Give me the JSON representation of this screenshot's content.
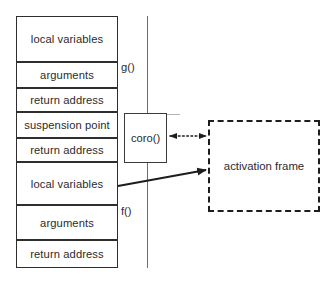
{
  "diagram": {
    "colors": {
      "row_border": "#2e2e2e",
      "bracket": "#6d6d6d",
      "coro_border": "#3a3a3a",
      "activation_border": "#1d1d1d",
      "text": "#2b2b2b",
      "background": "#ffffff"
    },
    "stack": {
      "rows": [
        {
          "label": "local variables",
          "top": 16,
          "height": 46
        },
        {
          "label": "arguments",
          "top": 62,
          "height": 26
        },
        {
          "label": "return address",
          "top": 88,
          "height": 24
        },
        {
          "label": "suspension point",
          "top": 112,
          "height": 26
        },
        {
          "label": "return address",
          "top": 138,
          "height": 24
        },
        {
          "label": "local variables",
          "top": 162,
          "height": 43
        },
        {
          "label": "arguments",
          "top": 205,
          "height": 35
        },
        {
          "label": "return address",
          "top": 240,
          "height": 28
        }
      ],
      "left": 16,
      "width": 102
    },
    "frames": [
      {
        "label": "g()",
        "x": 121,
        "y": 68
      },
      {
        "label": "f()",
        "x": 121,
        "y": 212
      }
    ],
    "coro_box": {
      "label": "coro()",
      "left": 124,
      "top": 113,
      "width": 43,
      "height": 50
    },
    "activation_box": {
      "label": "activation frame",
      "left": 208,
      "top": 120,
      "width": 112,
      "height": 92
    },
    "connectors": [
      {
        "name": "coro-activation-link",
        "style": "dotted",
        "arrows": "both",
        "from": "coro()",
        "to": "activation frame"
      },
      {
        "name": "local-variables-activation-link",
        "style": "solid",
        "arrows": "end",
        "from": "local variables",
        "to": "activation frame"
      }
    ]
  }
}
